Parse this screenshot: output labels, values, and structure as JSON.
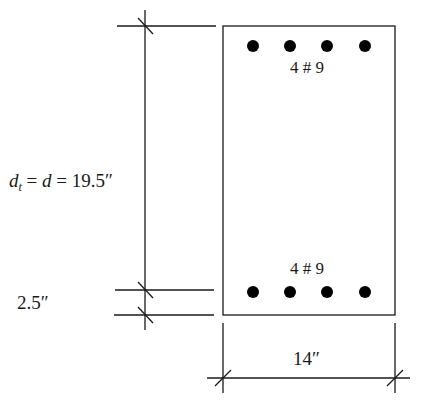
{
  "diagram": {
    "type": "reinforced-concrete-beam-cross-section",
    "top_reinforcement": {
      "label": "4 # 9",
      "count": 4
    },
    "bottom_reinforcement": {
      "label": "4 # 9",
      "count": 4
    },
    "effective_depth": {
      "var1": "d",
      "sub1": "t",
      "eq1": " = ",
      "var2": "d",
      "eq2": " = 19.5″"
    },
    "cover_dimension": "2.5″",
    "width_dimension": "14″",
    "colors": {
      "line": "#1a1a1a",
      "bar": "#000000",
      "background": "#ffffff"
    }
  }
}
